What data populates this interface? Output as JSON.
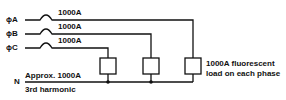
{
  "diagram": {
    "type": "circuit",
    "phases": [
      {
        "id": "A",
        "label": "ϕA",
        "current": "1000A"
      },
      {
        "id": "B",
        "label": "ϕB",
        "current": "1000A"
      },
      {
        "id": "C",
        "label": "ϕC",
        "current": "1000A"
      }
    ],
    "neutral": {
      "label": "N",
      "current": "Approx. 1000A",
      "note": "3rd harmonic"
    },
    "load": {
      "line1": "1000A fluorescent",
      "line2": "load on each phase"
    },
    "colors": {
      "line": "#111111",
      "background": "#ffffff"
    }
  }
}
